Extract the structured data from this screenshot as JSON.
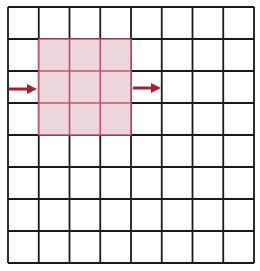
{
  "diagram": {
    "type": "grid-convolution",
    "grid": {
      "rows": 8,
      "cols": 8,
      "left": 8,
      "top": 7,
      "right": 254,
      "bottom": 263,
      "line_color": "#1a1a1a",
      "line_width": 1.8
    },
    "highlight": {
      "row_start": 1,
      "col_start": 1,
      "rows": 3,
      "cols": 3,
      "fill": "#ecd6db",
      "line_color": "#c0506a"
    },
    "arrows": [
      {
        "name": "incoming-arrow",
        "x1": 9,
        "y1": 89,
        "x2": 37,
        "y2": 89
      },
      {
        "name": "outgoing-arrow",
        "x1": 133,
        "y1": 88,
        "x2": 161,
        "y2": 88
      }
    ],
    "arrow_color": "#a32035"
  }
}
